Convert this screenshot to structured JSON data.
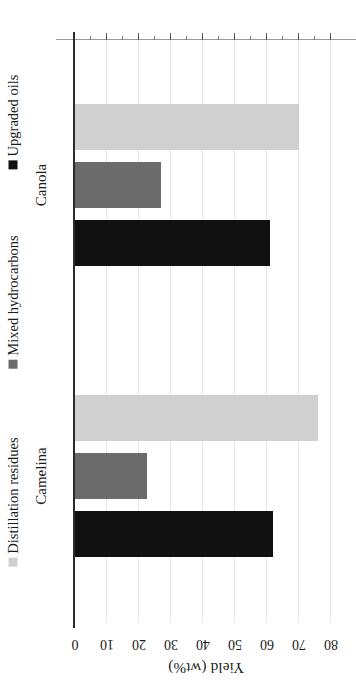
{
  "chart_data": {
    "type": "bar",
    "orientation": "horizontal",
    "title": "",
    "subtitle": "",
    "xlabel": "",
    "ylabel": "Yield (wt%)",
    "value_axis_label": "Yield (wt%)",
    "categories": [
      "Camelina",
      "Canola"
    ],
    "series": [
      {
        "name": "Upgraded oils",
        "color": "#111111",
        "values": [
          62,
          61
        ]
      },
      {
        "name": "Mixed hydrocarbons",
        "color": "#6b6b6b",
        "values": [
          22.5,
          27
        ]
      },
      {
        "name": "Distillation residues",
        "color": "#d0d0d0",
        "values": [
          76,
          70
        ]
      }
    ],
    "axis_range": [
      0,
      80
    ],
    "tick_labels": [
      "0",
      "10",
      "20",
      "30",
      "40",
      "50",
      "60",
      "70",
      "80"
    ],
    "tick_values": [
      0,
      10,
      20,
      30,
      40,
      50,
      60,
      70,
      80
    ],
    "minor_tick_step": 5,
    "grid": true,
    "grid_axis": "value",
    "legend_position": "bottom",
    "rotated_180": true
  },
  "legend": {
    "entries": [
      {
        "label": "Upgraded oils",
        "color": "#111111"
      },
      {
        "label": "Mixed hydrocarbons",
        "color": "#6b6b6b"
      },
      {
        "label": "Distillation residues",
        "color": "#d0d0d0"
      }
    ]
  },
  "axis": {
    "title": "Yield (wt%)"
  }
}
